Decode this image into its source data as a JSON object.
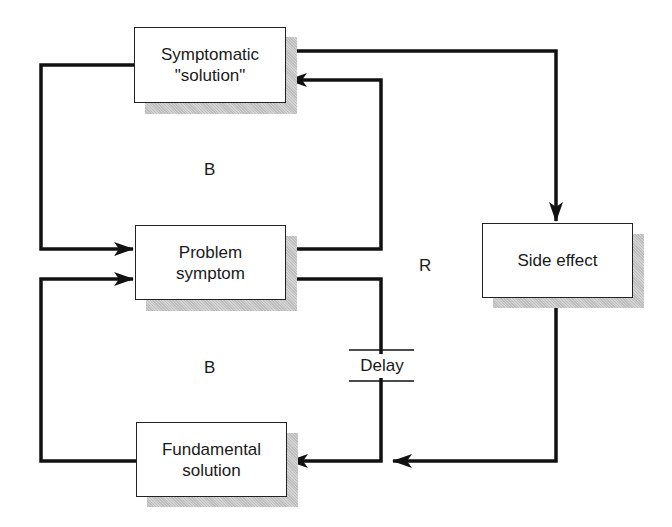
{
  "diagram": {
    "title": "",
    "type": "causal-loop",
    "nodes": [
      {
        "id": "symptomatic",
        "line1": "Symptomatic",
        "line2": "\"solution\""
      },
      {
        "id": "problem",
        "line1": "Problem",
        "line2": "symptom"
      },
      {
        "id": "side_effect",
        "line1": "Side effect",
        "line2": ""
      },
      {
        "id": "fundamental",
        "line1": "Fundamental",
        "line2": "solution"
      }
    ],
    "loop_labels": {
      "upper_balancing": "B",
      "lower_balancing": "B",
      "reinforcing": "R"
    },
    "delay_label": "Delay",
    "edges": [
      {
        "from": "symptomatic",
        "to": "problem"
      },
      {
        "from": "problem",
        "to": "symptomatic"
      },
      {
        "from": "symptomatic",
        "to": "side_effect"
      },
      {
        "from": "side_effect",
        "to": "fundamental"
      },
      {
        "from": "problem",
        "to": "fundamental",
        "delay": true
      },
      {
        "from": "fundamental",
        "to": "problem"
      }
    ],
    "colors": {
      "line": "#111111",
      "shadow": "#c8c8c8",
      "box_fill": "#ffffff"
    }
  }
}
